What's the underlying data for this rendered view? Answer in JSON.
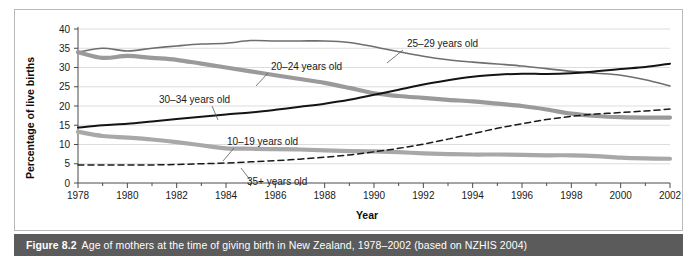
{
  "figure": {
    "caption_label": "Figure 8.2",
    "caption_text": "Age of mothers at the time of giving birth in New Zealand, 1978–2002 (based on NZHIS 2004)"
  },
  "chart_data": {
    "type": "line",
    "title": "",
    "xlabel": "Year",
    "ylabel": "Percentage of live births",
    "xlim": [
      1978,
      2002
    ],
    "ylim": [
      0,
      40
    ],
    "ytick_step": 5,
    "yticks": [
      0,
      5,
      10,
      15,
      20,
      25,
      30,
      35,
      40
    ],
    "xticks": [
      1978,
      1980,
      1982,
      1984,
      1986,
      1988,
      1990,
      1992,
      1994,
      1996,
      1998,
      2000,
      2002
    ],
    "xtick_minor_step": 1,
    "grid": "horizontal",
    "legend_position": "inline-annotations",
    "x": [
      1978,
      1979,
      1980,
      1981,
      1982,
      1983,
      1984,
      1985,
      1986,
      1987,
      1988,
      1989,
      1990,
      1991,
      1992,
      1993,
      1994,
      1995,
      1996,
      1997,
      1998,
      1999,
      2000,
      2001,
      2002
    ],
    "series": [
      {
        "name": "25–29 years old",
        "label": "25–29 years old",
        "color": "#6e6e6e",
        "style": "solid",
        "width": 1.6,
        "values": [
          34.0,
          35.0,
          34.3,
          35.0,
          35.6,
          36.1,
          36.3,
          37.0,
          36.9,
          36.9,
          36.9,
          36.5,
          35.4,
          34.1,
          32.9,
          32.0,
          31.4,
          30.9,
          30.4,
          29.7,
          29.0,
          28.5,
          28.0,
          26.8,
          25.2
        ]
      },
      {
        "name": "20–24 years old",
        "label": "20–24 years old",
        "color": "#9a9a9a",
        "style": "solid",
        "width": 4.2,
        "values": [
          34.0,
          32.5,
          33.0,
          32.5,
          32.0,
          31.0,
          30.0,
          29.0,
          28.0,
          27.0,
          26.0,
          24.7,
          23.3,
          22.6,
          22.1,
          21.6,
          21.2,
          20.6,
          20.0,
          19.1,
          18.0,
          17.4,
          17.1,
          17.0,
          17.0
        ]
      },
      {
        "name": "30–34 years old",
        "label": "30–34 years old",
        "color": "#141414",
        "style": "solid",
        "width": 2.0,
        "values": [
          14.4,
          15.0,
          15.4,
          16.0,
          16.6,
          17.2,
          17.8,
          18.3,
          19.0,
          19.8,
          20.6,
          21.6,
          22.9,
          24.2,
          25.6,
          26.7,
          27.6,
          28.1,
          28.4,
          28.3,
          28.5,
          29.0,
          29.6,
          30.1,
          31.0
        ]
      },
      {
        "name": "10–19 years old",
        "label": "10–19 years old",
        "color": "#a8a8a8",
        "style": "solid",
        "width": 4.2,
        "values": [
          13.3,
          12.2,
          11.8,
          11.3,
          10.6,
          9.8,
          9.0,
          8.9,
          8.8,
          8.7,
          8.5,
          8.3,
          8.2,
          8.0,
          7.7,
          7.5,
          7.4,
          7.4,
          7.3,
          7.2,
          7.2,
          7.0,
          6.6,
          6.4,
          6.3
        ]
      },
      {
        "name": "35+ years old",
        "label": "35+ years old",
        "color": "#1a1a1a",
        "style": "dashed",
        "width": 1.5,
        "values": [
          4.7,
          4.7,
          4.7,
          4.7,
          4.8,
          5.0,
          5.2,
          5.5,
          5.8,
          6.2,
          6.7,
          7.3,
          8.1,
          9.0,
          10.1,
          11.4,
          12.8,
          14.2,
          15.4,
          16.5,
          17.3,
          17.9,
          18.3,
          18.7,
          19.2
        ]
      }
    ],
    "annotations": [
      {
        "text": "25–29 years old",
        "text_x": 392,
        "text_y": 37,
        "leader": [
          [
            388,
            40
          ],
          [
            372,
            53
          ]
        ]
      },
      {
        "text": "20–24 years old",
        "text_x": 256,
        "text_y": 60,
        "leader": [
          [
            253,
            63
          ],
          [
            241,
            76
          ]
        ]
      },
      {
        "text": "30–34 years old",
        "text_x": 144,
        "text_y": 93,
        "leader": [
          [
            197,
            96
          ],
          [
            203,
            110
          ]
        ]
      },
      {
        "text": "10–19 years old",
        "text_x": 212,
        "text_y": 135,
        "leader": [
          [
            219,
            138
          ],
          [
            208,
            151
          ]
        ]
      },
      {
        "text": "35+ years old",
        "text_x": 232,
        "text_y": 175,
        "leader": [
          [
            236,
            171
          ],
          [
            226,
            158
          ]
        ]
      }
    ]
  }
}
